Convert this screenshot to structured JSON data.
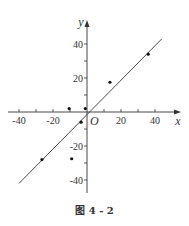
{
  "caption": "图 4 - 2",
  "chart_data": {
    "type": "scatter",
    "title": "",
    "caption": "图 4 - 2",
    "xlabel": "x",
    "ylabel": "y",
    "origin_label": "O",
    "xlim": [
      -45,
      48
    ],
    "ylim": [
      -50,
      48
    ],
    "x_ticks": [
      -40,
      -30,
      -20,
      -10,
      10,
      20,
      30,
      40
    ],
    "x_tick_labels": [
      -40,
      -20,
      20,
      40
    ],
    "y_ticks": [
      -40,
      -30,
      -20,
      -10,
      10,
      20,
      30,
      40
    ],
    "y_tick_labels": [
      40,
      20,
      -20,
      -40
    ],
    "grid": false,
    "legend": null,
    "series": [
      {
        "name": "data points",
        "type": "scatter",
        "points": [
          {
            "x": -26.5,
            "y": -28
          },
          {
            "x": -10.5,
            "y": 2
          },
          {
            "x": -1,
            "y": 2
          },
          {
            "x": -3.5,
            "y": -6
          },
          {
            "x": -9,
            "y": -27.5
          },
          {
            "x": 13.5,
            "y": 17.5
          },
          {
            "x": 36,
            "y": 34
          }
        ]
      },
      {
        "name": "regression line",
        "type": "line",
        "points": [
          {
            "x": -40,
            "y": -42
          },
          {
            "x": 44,
            "y": 43
          }
        ]
      }
    ]
  },
  "colors": {
    "axis": "#333333",
    "point": "#111111",
    "line": "#333333"
  }
}
